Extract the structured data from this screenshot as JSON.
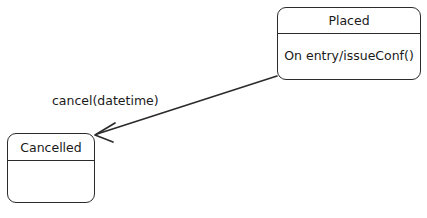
{
  "diagram": {
    "type": "uml-state-diagram",
    "background_color": "#ffffff",
    "stroke_color": "#2b2b2b",
    "text_color": "#1a1a1a",
    "states": [
      {
        "id": "placed",
        "name": "Placed",
        "body": "On entry/issueConf()"
      },
      {
        "id": "cancelled",
        "name": "Cancelled",
        "body": ""
      }
    ],
    "transitions": [
      {
        "id": "placed-to-cancelled",
        "label": "cancel(datetime)",
        "source": "Placed",
        "target": "Cancelled",
        "arrowhead": "open"
      }
    ]
  }
}
